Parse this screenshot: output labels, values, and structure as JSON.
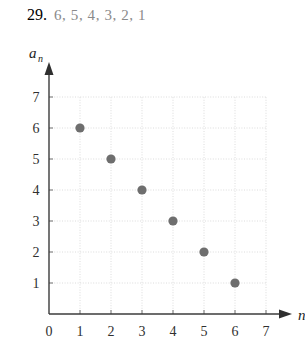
{
  "header": {
    "problem_number": "29.",
    "sequence_terms": "6, 5, 4, 3, 2, 1"
  },
  "chart_data": {
    "type": "scatter",
    "title": "",
    "xlabel": "n",
    "ylabel": "a_n",
    "ylabel_base": "a",
    "ylabel_subscript": "n",
    "x": [
      1,
      2,
      3,
      4,
      5,
      6
    ],
    "values": [
      6,
      5,
      4,
      3,
      2,
      1
    ],
    "xticks": [
      "0",
      "1",
      "2",
      "3",
      "4",
      "5",
      "6",
      "7"
    ],
    "yticks": [
      "1",
      "2",
      "3",
      "4",
      "5",
      "6",
      "7"
    ],
    "xlim": [
      0,
      7
    ],
    "ylim": [
      0,
      7
    ],
    "grid": true,
    "legend": false,
    "point_color": "#6e6e6e",
    "grid_color": "#d8d8d8",
    "axis_color": "#3b3b3b"
  }
}
